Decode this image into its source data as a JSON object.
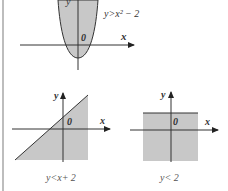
{
  "graphs": [
    {
      "id": "parabola",
      "inequality": "y>x²− 2",
      "axis_x": "x",
      "axis_y": "y",
      "origin": "0"
    },
    {
      "id": "line",
      "inequality": "y<x+ 2",
      "axis_x": "x",
      "axis_y": "y",
      "origin": "0"
    },
    {
      "id": "horizontal",
      "inequality": "y< 2",
      "axis_x": "x",
      "axis_y": "y",
      "origin": "0"
    }
  ],
  "colors": {
    "shade": "#c8c8c8",
    "line": "#333333",
    "border": "#bdbdbd"
  }
}
